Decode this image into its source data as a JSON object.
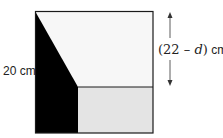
{
  "diagram": {
    "left_label": "20 cm",
    "right_label": {
      "open": "(22 ",
      "minus": "–",
      "var": "d",
      "close": ")",
      "unit": " cm"
    },
    "colors": {
      "outline": "#1a1a1a",
      "top_region": "#f7f7f7",
      "bottom_right_region": "#e4e4e4",
      "left_dark_region": "#000000",
      "arrow": "#333333"
    }
  }
}
